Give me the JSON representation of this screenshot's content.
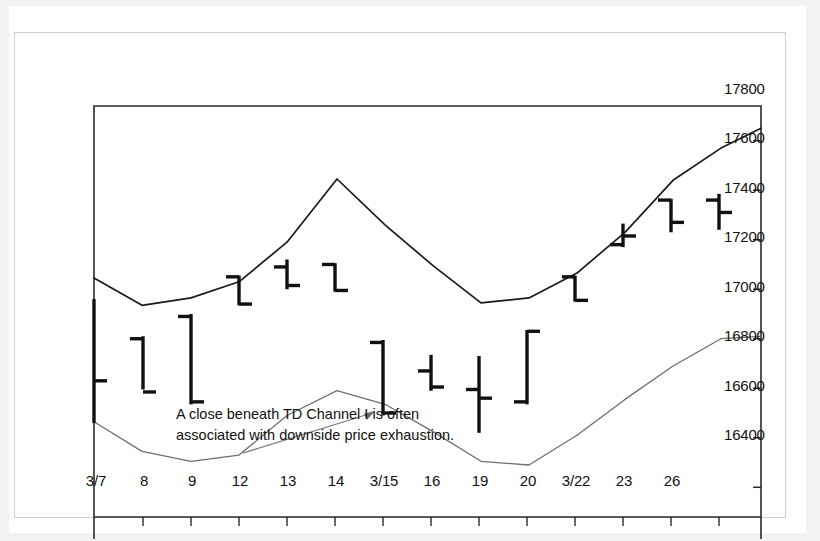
{
  "chart_data": {
    "type": "ohlc",
    "title": "",
    "xlabel": "",
    "ylabel": "",
    "ylim": [
      16280,
      17940
    ],
    "yticks": [
      17800,
      17600,
      17400,
      17200,
      17000,
      16800,
      16600,
      16400
    ],
    "xticklabels": [
      "3/7",
      "8",
      "9",
      "12",
      "13",
      "14",
      "3/15",
      "16",
      "19",
      "20",
      "3/22",
      "23",
      "26"
    ],
    "grid": false,
    "legend": "none",
    "bars": [
      {
        "date": "",
        "open": null,
        "high": 17160,
        "low": 16660,
        "close": 16830
      },
      {
        "date": "3/7",
        "open": 17000,
        "high": 17010,
        "low": 16795,
        "close": 16785
      },
      {
        "date": "8",
        "open": 17090,
        "high": 17100,
        "low": 16735,
        "close": 16745
      },
      {
        "date": "9",
        "open": 17250,
        "high": 17255,
        "low": 17135,
        "close": 17140
      },
      {
        "date": "12",
        "open": 17290,
        "high": 17320,
        "low": 17200,
        "close": 17215
      },
      {
        "date": "13",
        "open": 17300,
        "high": 17305,
        "low": 17190,
        "close": 17195
      },
      {
        "date": "14",
        "open": 16985,
        "high": 16995,
        "low": 16690,
        "close": 16700
      },
      {
        "date": "3/15",
        "open": 16870,
        "high": 16935,
        "low": 16790,
        "close": 16805
      },
      {
        "date": "16",
        "open": 16795,
        "high": 16930,
        "low": 16620,
        "close": 16760
      },
      {
        "date": "19",
        "open": 16745,
        "high": 17035,
        "low": 16735,
        "close": 17030
      },
      {
        "date": "20",
        "open": 17250,
        "high": 17255,
        "low": 17150,
        "close": 17155
      },
      {
        "date": "3/22",
        "open": 17380,
        "high": 17465,
        "low": 17370,
        "close": 17415
      },
      {
        "date": "23",
        "open": 17560,
        "high": 17565,
        "low": 17430,
        "close": 17470
      },
      {
        "date": "26",
        "open": 17560,
        "high": 17585,
        "low": 17440,
        "close": 17510
      }
    ],
    "series": [
      {
        "name": "TD Channel upper",
        "color": "#1a1a1a",
        "points": [
          [
            47,
            17245
          ],
          [
            95,
            17135
          ],
          [
            144,
            17165
          ],
          [
            192,
            17230
          ],
          [
            240,
            17390
          ],
          [
            290,
            17645
          ],
          [
            338,
            17460
          ],
          [
            386,
            17295
          ],
          [
            434,
            17145
          ],
          [
            482,
            17165
          ],
          [
            530,
            17265
          ],
          [
            578,
            17430
          ],
          [
            626,
            17640
          ],
          [
            674,
            17770
          ],
          [
            714,
            17850
          ]
        ]
      },
      {
        "name": "TD Channel I (lower)",
        "color": "#6f6f6f",
        "points": [
          [
            47,
            16665
          ],
          [
            95,
            16545
          ],
          [
            144,
            16505
          ],
          [
            192,
            16530
          ],
          [
            240,
            16690
          ],
          [
            290,
            16790
          ],
          [
            338,
            16735
          ],
          [
            386,
            16625
          ],
          [
            434,
            16505
          ],
          [
            482,
            16490
          ],
          [
            530,
            16610
          ],
          [
            578,
            16755
          ],
          [
            626,
            16890
          ],
          [
            674,
            17000
          ],
          [
            714,
            17010
          ]
        ]
      }
    ],
    "annotation": {
      "line1": "A close beneath TD Channel I is often",
      "line2": "associated with downside price exhaustion.",
      "arrow": {
        "from_x": 196,
        "from_y": 400,
        "to_x": 328,
        "to_y": 358
      }
    }
  },
  "colors": {
    "bar": "#111111",
    "upper_channel": "#1a1a1a",
    "lower_channel": "#6f6f6f",
    "frame": "#2a2a2a",
    "outer_frame": "#cfcfcf",
    "text": "#111111",
    "background": "#ffffff"
  }
}
